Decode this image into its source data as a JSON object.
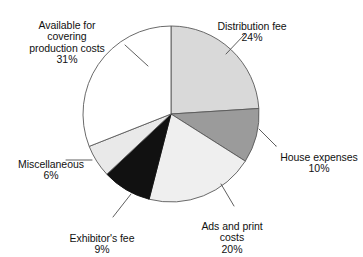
{
  "figure": {
    "width": 363,
    "height": 257,
    "background": "#ffffff",
    "title_clipped": "",
    "title_visible": false
  },
  "chart_data": {
    "type": "pie",
    "title": "",
    "xlabel": "",
    "ylabel": "",
    "legend": "none",
    "grid": false,
    "units": "percent",
    "start_angle_deg": 0,
    "direction": "clockwise",
    "center": {
      "x": 171,
      "y": 114
    },
    "radius": 88,
    "total": 100,
    "categories": [
      "Distribution fee",
      "House expenses",
      "Ads and print costs",
      "Exhibitor's fee",
      "Miscellaneous",
      "Available for covering production costs"
    ],
    "values": [
      24,
      10,
      20,
      9,
      6,
      31
    ],
    "slices": [
      {
        "name": "distribution-fee",
        "label": "Distribution fee",
        "value": 24,
        "percent_text": "24%",
        "fill": "#d9d9d9",
        "stroke": "#595959"
      },
      {
        "name": "house-expenses",
        "label": "House expenses",
        "value": 10,
        "percent_text": "10%",
        "fill": "#9b9b9b",
        "stroke": "#595959"
      },
      {
        "name": "ads-and-print-costs",
        "label": "Ads and print\ncosts",
        "value": 20,
        "percent_text": "20%",
        "fill": "#efefef",
        "stroke": "#595959"
      },
      {
        "name": "exhibitors-fee",
        "label": "Exhibitor's fee",
        "value": 9,
        "percent_text": "9%",
        "fill": "#111111",
        "stroke": "#111111"
      },
      {
        "name": "miscellaneous",
        "label": "Miscellaneous",
        "value": 6,
        "percent_text": "6%",
        "fill": "#e9e9e9",
        "stroke": "#595959"
      },
      {
        "name": "available-for-covering-production-costs",
        "label": "Available for\ncovering\nproduction costs",
        "value": 31,
        "percent_text": "31%",
        "fill": "#ffffff",
        "stroke": "#595959"
      }
    ]
  },
  "labels": {
    "available": {
      "text": "Available for\ncovering\nproduction costs",
      "percent": "31%"
    },
    "distribution": {
      "text": "Distribution fee",
      "percent": "24%"
    },
    "house": {
      "text": "House expenses",
      "percent": "10%"
    },
    "ads": {
      "text": "Ads and print\ncosts",
      "percent": "20%"
    },
    "exhibitor": {
      "text": "Exhibitor's fee",
      "percent": "9%"
    },
    "miscellaneous": {
      "text": "Miscellaneous",
      "percent": "6%"
    }
  },
  "colors": {
    "leader_line": "#4d4d4d",
    "pie_outline": "#595959",
    "text": "#111111"
  }
}
